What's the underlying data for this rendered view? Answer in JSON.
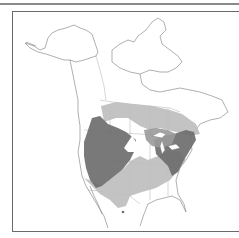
{
  "map": {
    "title": "Species range map — North America",
    "region": "North America",
    "colors": {
      "background": "#ffffff",
      "outline": "#7a7a7a",
      "frame": "#6a6a6a",
      "range_dark": "#6e6e6e",
      "range_light": "#bdbdbd",
      "range_medium": "#9a9a9a"
    },
    "legend": {
      "dark": "Core range (western/central US, Northeast)",
      "light": "Peripheral range (Canada prairies, southern US, Mexico)"
    }
  }
}
